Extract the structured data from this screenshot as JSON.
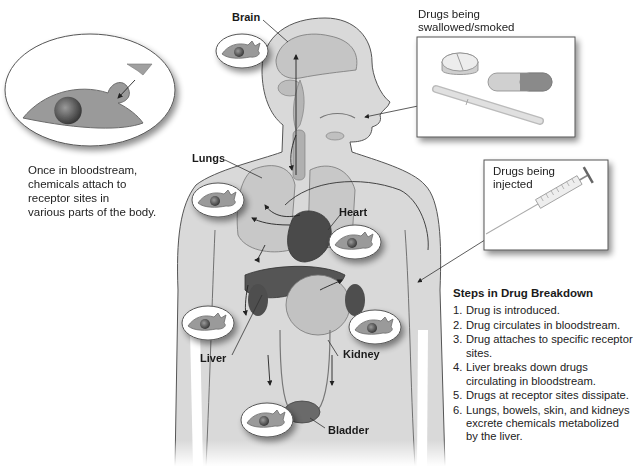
{
  "labels": {
    "brain": "Brain",
    "lungs": "Lungs",
    "heart": "Heart",
    "liver": "Liver",
    "kidney": "Kidney",
    "bladder": "Bladder"
  },
  "callouts": {
    "receptor_caption": [
      "Once in bloodstream,",
      "chemicals attach to",
      "receptor sites in",
      "various parts of the body."
    ],
    "swallowed_box": {
      "title_lines": [
        "Drugs being",
        "swallowed/smoked"
      ],
      "icons": [
        "pill-icon",
        "capsule-icon",
        "cigarette-icon"
      ]
    },
    "injected_box": {
      "title_lines": [
        "Drugs being",
        "injected"
      ],
      "icons": [
        "syringe-icon"
      ]
    }
  },
  "steps": {
    "title": "Steps in Drug Breakdown",
    "items": [
      {
        "num": "1.",
        "text": "Drug is introduced."
      },
      {
        "num": "2.",
        "text": "Drug circulates in bloodstream."
      },
      {
        "num": "3.",
        "text": "Drug attaches to specific receptor sites."
      },
      {
        "num": "4.",
        "text": "Liver breaks down drugs circulating in bloodstream."
      },
      {
        "num": "5.",
        "text": "Drugs at receptor sites dissipate."
      },
      {
        "num": "6.",
        "text": "Lungs, bowels, skin, and kidneys excrete chemicals metabolized by the liver."
      }
    ]
  },
  "colors": {
    "body_fill": "#d9d9d9",
    "body_outline": "#555555",
    "organ_dark": "#4a4a4a",
    "organ_mid": "#8a8a8a",
    "cell_fill": "#9a9a9a",
    "oval_fill": "#ffffff"
  }
}
